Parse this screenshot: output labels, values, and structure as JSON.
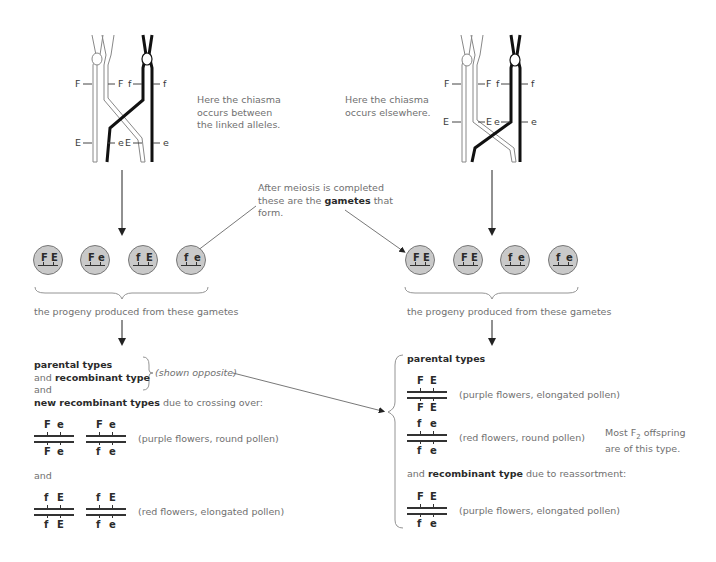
{
  "left_panel": {
    "chromosome_labels": {
      "top_left_outer": "F",
      "top_left_inner": "F",
      "top_right_inner": "f",
      "top_right_outer": "f",
      "bottom_left_outer": "E",
      "bottom_left_inner": "e",
      "bottom_right_inner": "E",
      "bottom_right_outer": "e"
    },
    "caption": [
      "Here the chiasma",
      "occurs between",
      "the linked alleles."
    ],
    "gametes": [
      {
        "a": "F",
        "b": "E"
      },
      {
        "a": "F",
        "b": "e"
      },
      {
        "a": "f",
        "b": "E"
      },
      {
        "a": "f",
        "b": "e"
      }
    ],
    "progeny_caption": "the progeny produced from these gametes",
    "result": {
      "line1_bold": "parental types",
      "line2_pre": "and ",
      "line2_bold": "recombinant type",
      "shown_opposite": "(shown opposite)",
      "line3": "and",
      "line4_bold": "new recombinant types",
      "line4_rest": " due to crossing over:",
      "group1": {
        "genotypes": [
          {
            "top": [
              "F",
              "e"
            ],
            "bottom": [
              "F",
              "e"
            ]
          },
          {
            "top": [
              "F",
              "e"
            ],
            "bottom": [
              "f",
              "e"
            ]
          }
        ],
        "phenotype": "(purple flowers, round pollen)"
      },
      "and_label": "and",
      "group2": {
        "genotypes": [
          {
            "top": [
              "f",
              "E"
            ],
            "bottom": [
              "f",
              "E"
            ]
          },
          {
            "top": [
              "f",
              "E"
            ],
            "bottom": [
              "f",
              "e"
            ]
          }
        ],
        "phenotype": "(red flowers, elongated pollen)"
      }
    }
  },
  "center": {
    "gametes_note": {
      "line1": "After meiosis is completed",
      "line2_pre": "these are the ",
      "line2_bold": "gametes",
      "line2_post": " that",
      "line3": "form."
    }
  },
  "right_panel": {
    "chromosome_labels": {
      "f_left_outer": "F",
      "f_left_inner": "F",
      "f_right_inner": "f",
      "f_right_outer": "f",
      "e_left_outer": "E",
      "e_left_inner": "E",
      "e_right_inner": "e",
      "e_right_outer": "e"
    },
    "caption": [
      "Here the chiasma",
      "occurs elsewhere."
    ],
    "gametes": [
      {
        "a": "F",
        "b": "E"
      },
      {
        "a": "F",
        "b": "E"
      },
      {
        "a": "f",
        "b": "e"
      },
      {
        "a": "f",
        "b": "e"
      }
    ],
    "progeny_caption": "the progeny produced from these gametes",
    "result": {
      "parental_label": "parental types",
      "parental": [
        {
          "top": [
            "F",
            "E"
          ],
          "bottom": [
            "F",
            "E"
          ],
          "phenotype": "(purple flowers, elongated pollen)"
        },
        {
          "top": [
            "f",
            "e"
          ],
          "bottom": [
            "f",
            "e"
          ],
          "phenotype": "(red flowers, round pollen)"
        }
      ],
      "most_note_pre": "Most F",
      "most_note_sub": "2",
      "most_note_post": " offspring",
      "most_note_line2": "are of this type.",
      "recomb_pre": "and ",
      "recomb_bold": "recombinant type",
      "recomb_post": " due to reassortment:",
      "recombinant": {
        "top": [
          "F",
          "E"
        ],
        "bottom": [
          "f",
          "e"
        ],
        "phenotype": "(purple flowers, elongated pollen)"
      }
    }
  }
}
